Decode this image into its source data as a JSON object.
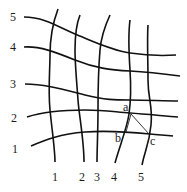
{
  "diagram": {
    "row_labels": [
      {
        "text": "5",
        "x": 10,
        "y": 11
      },
      {
        "text": "4",
        "x": 10,
        "y": 41
      },
      {
        "text": "3",
        "x": 10,
        "y": 78
      },
      {
        "text": "2",
        "x": 11,
        "y": 112
      },
      {
        "text": "1",
        "x": 12,
        "y": 143
      }
    ],
    "column_labels": [
      {
        "text": "1",
        "x": 52,
        "y": 171
      },
      {
        "text": "2",
        "x": 79,
        "y": 171
      },
      {
        "text": "3",
        "x": 94,
        "y": 171
      },
      {
        "text": "4",
        "x": 111,
        "y": 171
      },
      {
        "text": "5",
        "x": 138,
        "y": 171
      }
    ],
    "point_labels": [
      {
        "text": "a",
        "x": 123,
        "y": 101
      },
      {
        "text": "b",
        "x": 115,
        "y": 132
      },
      {
        "text": "c",
        "x": 150,
        "y": 135
      }
    ],
    "horizontal_curves": [
      "M24,17 C45,17 60,28 75,34 S110,50 130,53 S160,56 176,55",
      "M24,47 C40,46 55,52 75,60 S110,70 130,71 S165,74 180,76",
      "M25,84 C45,84 65,90 85,95 S115,100 130,100 S165,101 178,101",
      "M27,117 C45,111 65,110 85,110 S115,112 130,113 S165,116 178,117",
      "M31,146 C45,140 60,134 85,132 S140,133 150,134 S165,135 173,136"
    ],
    "vertical_curves": [
      "M58,9 C52,25 50,40 50,55 S48,90 50,110 S55,150 55,162",
      "M80,15 C76,25 75,35 75,50 S77,85 78,100 S84,140 84,162",
      "M110,15 C104,28 101,38 100,50 S98,90 98,110 S97,150 97,162",
      "M130,20 C128,35 129,55 130,70 S131,100 129,114 S120,145 115,163",
      "M148,25 C147,40 148,60 148,80 S153,105 151,125 S145,150 142,165"
    ],
    "segments": [
      {
        "name": "a-c",
        "x1": 131,
        "y1": 114,
        "x2": 149,
        "y2": 134
      },
      {
        "name": "a-b",
        "x1": 131,
        "y1": 114,
        "x2": 126,
        "y2": 132
      }
    ]
  }
}
